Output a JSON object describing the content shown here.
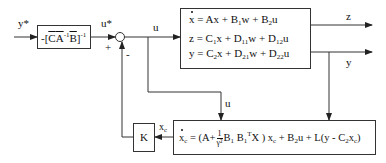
{
  "diagram": {
    "type": "block-diagram",
    "labels": {
      "reference_input": "y*",
      "feedforward_output": "u*",
      "plus_sign": "+",
      "minus_sign": "-",
      "control_signal_top": "u",
      "control_signal_to_controller": "u",
      "performance_output": "z",
      "measured_output": "y",
      "controller_state": "x_c"
    },
    "blocks": {
      "feedforward_gain": {
        "text_prefix": "-[",
        "C": "C",
        "A": "A",
        "A_exp": "-1",
        "B": "B",
        "close": "]",
        "outer_exp": "-1"
      },
      "plant": {
        "line1": {
          "lhs": "x",
          "rhs": "= Ax + B",
          "b_sub": "1",
          "rest1": "w + B",
          "b2_sub": "2",
          "rest2": "u"
        },
        "line2": {
          "lhs": "z",
          "rhs": "= C",
          "c_sub": "1",
          "rest1": "x + D",
          "d_sub1": "11",
          "rest2": "w + D",
          "d_sub2": "12",
          "rest3": "u"
        },
        "line3": {
          "lhs": "y",
          "rhs": "= C",
          "c_sub": "2",
          "rest1": "x + D",
          "d_sub1": "21",
          "rest2": "w + D",
          "d_sub2": "22",
          "rest3": "u"
        }
      },
      "gain_K": {
        "label": "K"
      },
      "controller": {
        "lhs": "x",
        "lhs_sub": "c",
        "part1": "= (A+",
        "frac_num": "1",
        "frac_den": "γ²",
        "part2": "B",
        "b1_sub": "1",
        "part3": " B",
        "b1t_sub": "1",
        "b1t_sup": "T",
        "part4": "X ) x",
        "xc_sub": "c",
        "part5": " + B",
        "b2_sub": "2",
        "part6": "u + L(y - C",
        "c2_sub": "2",
        "part7": "x",
        "xc2_sub": "c",
        "part8": ")"
      }
    },
    "colors": {
      "line": "#333333",
      "text": "#111111",
      "background": "#ffffff"
    }
  }
}
